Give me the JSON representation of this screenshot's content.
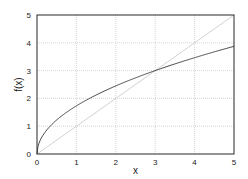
{
  "chart_data": {
    "type": "line",
    "title": "",
    "xlabel": "x",
    "ylabel": "f(x)",
    "xlim": [
      0,
      5
    ],
    "ylim": [
      0,
      5
    ],
    "xticks": [
      0,
      1,
      2,
      3,
      4,
      5
    ],
    "yticks": [
      0,
      1,
      2,
      3,
      4,
      5
    ],
    "grid": true,
    "legend": null,
    "series": [
      {
        "name": "f(x)",
        "color": "#333333",
        "x": [
          0,
          0.05,
          0.1,
          0.2,
          0.3,
          0.5,
          0.75,
          1,
          1.5,
          2,
          2.5,
          3,
          3.5,
          4,
          4.5,
          5
        ],
        "values": [
          0,
          0.39,
          0.55,
          0.77,
          0.95,
          1.22,
          1.5,
          1.73,
          2.12,
          2.45,
          2.74,
          3.0,
          3.24,
          3.46,
          3.67,
          3.87
        ]
      },
      {
        "name": "y = x",
        "color": "#cccccc",
        "x": [
          0,
          5
        ],
        "values": [
          0,
          5
        ]
      }
    ]
  },
  "colors": {
    "grid": "#bbbbbb",
    "frame": "#333333"
  }
}
